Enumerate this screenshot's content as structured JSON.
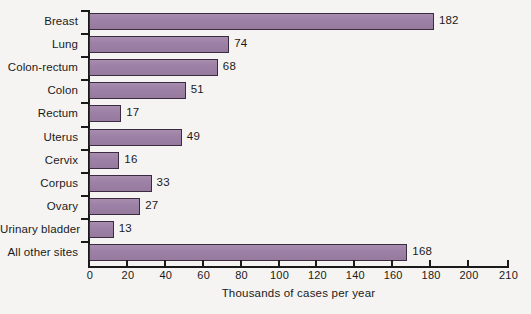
{
  "chart_data": {
    "type": "bar",
    "orientation": "horizontal",
    "title": "",
    "subtitle": "",
    "xlabel": "Thousands of cases per year",
    "ylabel": "",
    "categories": [
      "Breast",
      "Lung",
      "Colon-rectum",
      "Colon",
      "Rectum",
      "Uterus",
      "Cervix",
      "Corpus",
      "Ovary",
      "Urinary bladder",
      "All other sites"
    ],
    "values": [
      182,
      74,
      68,
      51,
      17,
      49,
      16,
      33,
      27,
      13,
      168
    ],
    "data_labels": [
      "182",
      "74",
      "68",
      "51",
      "17",
      "49",
      "16",
      "33",
      "27",
      "13",
      "168"
    ],
    "xticks": [
      0,
      20,
      40,
      60,
      80,
      100,
      120,
      140,
      160,
      180,
      200,
      210
    ],
    "xtick_labels": [
      "0",
      "20",
      "40",
      "60",
      "80",
      "100",
      "120",
      "140",
      "160",
      "180",
      "200",
      "210"
    ],
    "xlim": [
      0,
      210
    ],
    "grid": false,
    "legend": null,
    "bar_color": "#9d80a5",
    "bar_edge_color": "#3b2b40",
    "axis_color": "#1a1a1a",
    "background_color": "#f5f4f2"
  }
}
